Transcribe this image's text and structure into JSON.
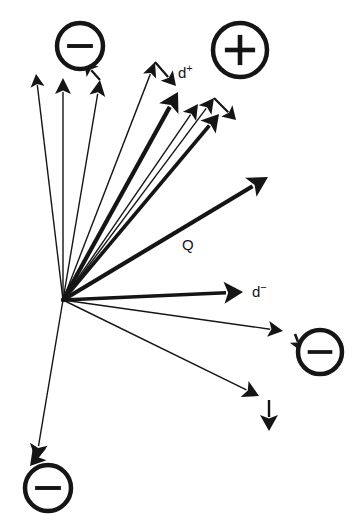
{
  "figure": {
    "type": "vector-diagram",
    "width": 354,
    "height": 527,
    "background": "#ffffff",
    "ink_color": "#151515",
    "origin": {
      "x": 63,
      "y": 300,
      "label": "vector-origin"
    }
  },
  "labels": [
    {
      "id": "d-plus",
      "base": "d",
      "sup": "+",
      "x": 178,
      "y": 78,
      "name": "label-d-plus"
    },
    {
      "id": "q",
      "base": "Q",
      "sup": "",
      "x": 182,
      "y": 250,
      "name": "label-q"
    },
    {
      "id": "d-minus",
      "base": "d",
      "sup": "−",
      "x": 252,
      "y": 297,
      "name": "label-d-minus"
    }
  ],
  "charges": [
    {
      "id": "minus-top-left",
      "sign": "−",
      "polarity": "negative",
      "cx": 80,
      "cy": 46,
      "r": 23,
      "ring_width": 4.5,
      "name": "charge-minus-top-left"
    },
    {
      "id": "plus-top-right",
      "sign": "+",
      "polarity": "positive",
      "cx": 240,
      "cy": 50,
      "r": 27,
      "ring_width": 4.5,
      "name": "charge-plus-top-right"
    },
    {
      "id": "minus-right",
      "sign": "−",
      "polarity": "negative",
      "cx": 320,
      "cy": 352,
      "r": 22,
      "ring_width": 4.5,
      "name": "charge-minus-right"
    },
    {
      "id": "minus-bottom-left",
      "sign": "−",
      "polarity": "negative",
      "cx": 48,
      "cy": 488,
      "r": 23,
      "ring_width": 4.5,
      "name": "charge-minus-bottom-left"
    }
  ],
  "vectors": [
    {
      "id": "v-up-left",
      "name": "vector-up-left",
      "x1": 63,
      "y1": 300,
      "x2": 36,
      "y2": 74,
      "width": 1.4,
      "head": 13,
      "head_w": 7
    },
    {
      "id": "v-up",
      "name": "vector-up",
      "x1": 63,
      "y1": 300,
      "x2": 63,
      "y2": 78,
      "width": 1.4,
      "head": 16,
      "head_w": 8
    },
    {
      "id": "v-up-right-near",
      "name": "vector-up-right-near",
      "x1": 63,
      "y1": 300,
      "x2": 100,
      "y2": 80,
      "width": 1.4,
      "head": 16,
      "head_w": 8
    },
    {
      "id": "v-to-dplus-thin",
      "name": "vector-to-d-plus-thin",
      "x1": 63,
      "y1": 300,
      "x2": 155,
      "y2": 62,
      "width": 1.4,
      "head": 15,
      "head_w": 7
    },
    {
      "id": "v-to-dplus-bold",
      "name": "vector-to-d-plus-bold",
      "x1": 63,
      "y1": 300,
      "x2": 178,
      "y2": 92,
      "width": 4.2,
      "head": 19,
      "head_w": 11
    },
    {
      "id": "v-cluster-a",
      "name": "vector-cluster-a",
      "x1": 63,
      "y1": 300,
      "x2": 198,
      "y2": 104,
      "width": 1.4,
      "head": 15,
      "head_w": 8
    },
    {
      "id": "v-cluster-b",
      "name": "vector-cluster-b",
      "x1": 63,
      "y1": 300,
      "x2": 214,
      "y2": 98,
      "width": 1.4,
      "head": 15,
      "head_w": 8
    },
    {
      "id": "v-cluster-c",
      "name": "vector-cluster-c",
      "x1": 63,
      "y1": 300,
      "x2": 219,
      "y2": 114,
      "width": 3.6,
      "head": 17,
      "head_w": 10
    },
    {
      "id": "v-q",
      "name": "vector-q",
      "x1": 63,
      "y1": 300,
      "x2": 268,
      "y2": 177,
      "width": 4.2,
      "head": 20,
      "head_w": 11
    },
    {
      "id": "v-d-minus",
      "name": "vector-d-minus",
      "x1": 63,
      "y1": 300,
      "x2": 243,
      "y2": 292,
      "width": 3.6,
      "head": 19,
      "head_w": 11
    },
    {
      "id": "v-to-minus-right",
      "name": "vector-to-minus-right",
      "x1": 63,
      "y1": 300,
      "x2": 283,
      "y2": 331,
      "width": 1.4,
      "head": 15,
      "head_w": 8
    },
    {
      "id": "v-lower-right",
      "name": "vector-lower-right",
      "x1": 63,
      "y1": 300,
      "x2": 259,
      "y2": 396,
      "width": 1.4,
      "head": 16,
      "head_w": 9
    },
    {
      "id": "v-down-left",
      "name": "vector-down-left",
      "x1": 63,
      "y1": 300,
      "x2": 36,
      "y2": 461,
      "width": 1.4,
      "head": 17,
      "head_w": 9
    }
  ],
  "secondary_vectors": [
    {
      "id": "s-dplus-hook",
      "name": "vector-hook-d-plus",
      "x1": 155,
      "y1": 62,
      "x2": 176,
      "y2": 86,
      "width": 2.2,
      "head": 14,
      "head_w": 8
    },
    {
      "id": "s-cluster-hook",
      "name": "vector-hook-cluster",
      "x1": 214,
      "y1": 98,
      "x2": 236,
      "y2": 120,
      "width": 2.2,
      "head": 13,
      "head_w": 8
    },
    {
      "id": "s-top-left-hook",
      "name": "vector-hook-top-left",
      "x1": 100,
      "y1": 80,
      "x2": 84,
      "y2": 62,
      "width": 2.2,
      "head": 13,
      "head_w": 8
    },
    {
      "id": "s-minus-right",
      "name": "vector-hook-minus-right",
      "x1": 295,
      "y1": 334,
      "x2": 302,
      "y2": 352,
      "width": 2.6,
      "head": 13,
      "head_w": 8
    },
    {
      "id": "s-lower-down",
      "name": "vector-hook-lower-down",
      "x1": 269,
      "y1": 400,
      "x2": 269,
      "y2": 431,
      "width": 2.4,
      "head": 16,
      "head_w": 9
    },
    {
      "id": "s-bottom-left",
      "name": "vector-hook-bottom-left",
      "x1": 45,
      "y1": 448,
      "x2": 30,
      "y2": 466,
      "width": 2.4,
      "head": 15,
      "head_w": 9
    }
  ]
}
